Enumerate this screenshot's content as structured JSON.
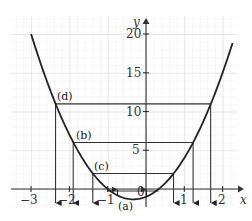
{
  "chart_data": {
    "type": "line",
    "title": "",
    "xlabel": "x",
    "ylabel": "y",
    "xlim": [
      -3.5,
      2.4
    ],
    "ylim": [
      -2.3,
      22.5
    ],
    "grid": true,
    "x_ticks": [
      -3,
      -2,
      -1,
      1,
      2
    ],
    "x_tick_labels": [
      "−3",
      "−2",
      "−1",
      "1",
      "2"
    ],
    "y_ticks": [
      0,
      5,
      10,
      15,
      20
    ],
    "y_tick_labels": [
      "0",
      "5",
      "10",
      "15",
      "20"
    ],
    "series": [
      {
        "name": "y = 3x² + 2x − 1",
        "type": "curve",
        "x_range": [
          -3,
          2.26
        ],
        "coefficients": {
          "a": 3,
          "b": 2,
          "c": -1
        }
      }
    ],
    "horizontal_lines": [
      {
        "label": "(a)",
        "y": 0,
        "x_intersections": [
          -1,
          0.33
        ]
      },
      {
        "label": "(c)",
        "y": 2,
        "x_intersections": [
          -1.39,
          0.72
        ]
      },
      {
        "label": "(b)",
        "y": 6,
        "x_intersections": [
          -1.9,
          1.23
        ]
      },
      {
        "label": "(d)",
        "y": 11,
        "x_intersections": [
          -2.36,
          1.69
        ]
      }
    ],
    "annotations": [
      "(a)",
      "(b)",
      "(c)",
      "(d)"
    ]
  },
  "labels": {
    "x_axis": "x",
    "y_axis": "y",
    "origin": "0",
    "case_a": "(a)",
    "case_b": "(b)",
    "case_c": "(c)",
    "case_d": "(d)",
    "xt_m3": "−3",
    "xt_m2": "−2",
    "xt_m1": "−1",
    "xt_1": "1",
    "xt_2": "2",
    "yt_5": "5",
    "yt_10": "10",
    "yt_15": "15",
    "yt_20": "20"
  },
  "colors": {
    "grid": "#d9d9d9",
    "curve": "#222222",
    "axis": "#333333"
  }
}
